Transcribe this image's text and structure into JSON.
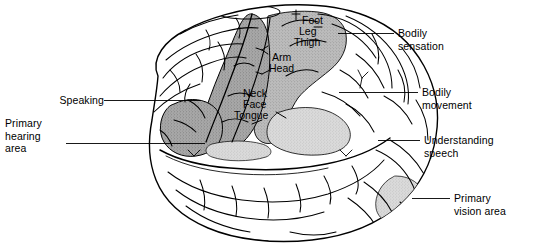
{
  "figure": {
    "background_color": "#ffffff",
    "line_color": "#000000",
    "text_color": "#000000"
  },
  "shading": {
    "motor_cortex_color": "#a8a8a8",
    "broca_area_color": "#a8a8a8",
    "sensory_cortex_color": "#b8b8b8",
    "wernicke_area_color": "#d8d8d8",
    "vision_area_color": "#cfcfcf",
    "unshaded_cortex_color": "#ffffff"
  },
  "callouts": {
    "left": [
      {
        "id": "speaking",
        "label": "Speaking",
        "x": 44,
        "y": 94,
        "align": "right",
        "leader": {
          "x1": 104,
          "y1": 100,
          "x2": 201,
          "y2": 100
        }
      },
      {
        "id": "primary-hearing-area",
        "label": "Primary\nhearing\narea",
        "x": 5,
        "y": 117,
        "align": "left",
        "leader": {
          "x1": 66,
          "y1": 143,
          "x2": 205,
          "y2": 143
        }
      }
    ],
    "right": [
      {
        "id": "bodily-sensation",
        "label": "Bodily\nsensation",
        "x": 398,
        "y": 27,
        "leader": {
          "x1": 338,
          "y1": 33,
          "x2": 394,
          "y2": 33
        }
      },
      {
        "id": "bodily-movement",
        "label": "Bodily\nmovement",
        "x": 422,
        "y": 86,
        "leader": {
          "x1": 339,
          "y1": 92,
          "x2": 418,
          "y2": 92
        }
      },
      {
        "id": "understanding-speech",
        "label": "Understanding\nspeech",
        "x": 424,
        "y": 134,
        "leader": {
          "x1": 378,
          "y1": 140,
          "x2": 420,
          "y2": 140
        }
      },
      {
        "id": "primary-vision-area",
        "label": "Primary\nvision area",
        "x": 454,
        "y": 192,
        "leader": {
          "x1": 412,
          "y1": 198,
          "x2": 450,
          "y2": 198
        }
      }
    ]
  },
  "homunculus_labels": [
    {
      "id": "foot",
      "label": "Foot",
      "x": 302,
      "y": 15
    },
    {
      "id": "leg",
      "label": "Leg",
      "x": 299,
      "y": 26
    },
    {
      "id": "thigh",
      "label": "Thigh",
      "x": 294,
      "y": 37
    },
    {
      "id": "arm",
      "label": "Arm",
      "x": 272,
      "y": 52
    },
    {
      "id": "head",
      "label": "Head",
      "x": 269,
      "y": 63
    },
    {
      "id": "neck",
      "label": "Neck",
      "x": 243,
      "y": 88
    },
    {
      "id": "face",
      "label": "Face",
      "x": 243,
      "y": 99
    },
    {
      "id": "tongue",
      "label": "Tongue",
      "x": 234,
      "y": 110
    }
  ]
}
